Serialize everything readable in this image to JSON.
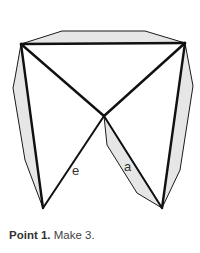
{
  "diagram": {
    "labels": {
      "e": "e",
      "a": "a"
    },
    "colors": {
      "flap_fill": "#e6e6e6",
      "line": "#111111",
      "background": "#ffffff"
    }
  },
  "caption": {
    "step": "Point 1.",
    "instruction": "Make 3."
  }
}
